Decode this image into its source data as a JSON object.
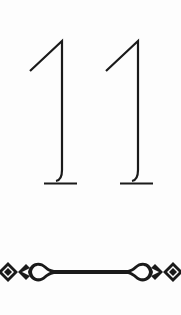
{
  "card": {
    "number": "11",
    "ink_color": "#1a1a1a",
    "background": "#fdfdfd"
  },
  "ornament": {
    "type": "divider",
    "icon": "scroll-divider-icon"
  }
}
